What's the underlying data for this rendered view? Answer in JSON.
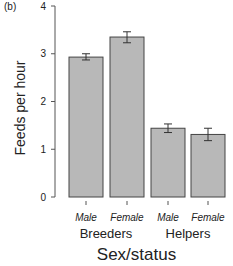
{
  "panel_label": "(b)",
  "chart_data": {
    "type": "bar",
    "title": "",
    "xlabel": "Sex/status",
    "ylabel": "Feeds per hour",
    "ylim": [
      0,
      4
    ],
    "yticks": [
      0,
      1,
      2,
      3,
      4
    ],
    "grid": false,
    "groups": [
      "Breeders",
      "Helpers"
    ],
    "categories": [
      "Male",
      "Female",
      "Male",
      "Female"
    ],
    "category_groups": [
      "Breeders",
      "Breeders",
      "Helpers",
      "Helpers"
    ],
    "values": [
      2.93,
      3.35,
      1.44,
      1.31
    ],
    "error_low": [
      2.87,
      3.23,
      1.35,
      1.18
    ],
    "error_high": [
      3.0,
      3.46,
      1.53,
      1.44
    ],
    "bar_color": "#b8b8b8",
    "edge_color": "#444444"
  }
}
